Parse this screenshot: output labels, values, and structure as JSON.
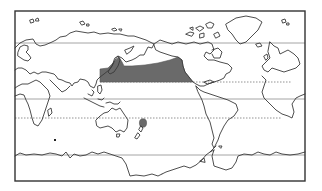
{
  "map": {
    "projection": "world map, Pacific-centered",
    "colors": {
      "background": "#ffffff",
      "coastline": "#3a3a3a",
      "frame": "#333333",
      "shaded_region": "#6a6a6a",
      "latitude_solid": "#9a9a9a",
      "latitude_dotted": "#777777"
    },
    "frame": {
      "x": 15,
      "y": 11,
      "width": 290,
      "height": 170
    },
    "latitude_lines": [
      {
        "name": "northern-solid-line",
        "style": "solid",
        "y": 43,
        "x1": 15,
        "x2": 305
      },
      {
        "name": "northern-dotted-line",
        "style": "dotted",
        "y": 82,
        "x1": 100,
        "x2": 292
      },
      {
        "name": "equator-solid-line",
        "style": "solid",
        "y": 99,
        "x1": 15,
        "x2": 305
      },
      {
        "name": "southern-dotted-line",
        "style": "dotted",
        "y": 118,
        "x1": 15,
        "x2": 282
      },
      {
        "name": "southern-solid-line",
        "style": "solid",
        "y": 155,
        "x1": 15,
        "x2": 305
      }
    ],
    "shaded_regions": [
      {
        "name": "north-pacific-shaded-band",
        "label": ""
      },
      {
        "name": "new-zealand-shaded-spot",
        "label": "",
        "cx": 143,
        "cy": 123,
        "r": 4
      }
    ],
    "markers": [
      {
        "name": "indian-ocean-dot",
        "x": 55,
        "y": 140
      }
    ]
  }
}
